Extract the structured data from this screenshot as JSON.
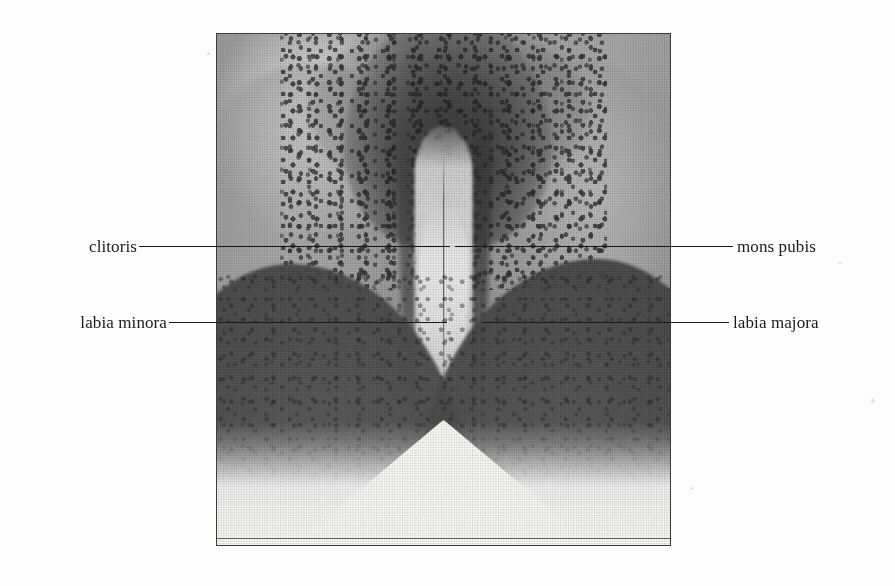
{
  "figure": {
    "background_color": "#fdfdfd",
    "plate": {
      "name": "female-external-genitalia-halftone-plate",
      "border_color": "#3b3b3b",
      "left": 216,
      "top": 33,
      "width": 455,
      "height": 513
    },
    "label_color": "#1b1b1b",
    "leader_color": "#1d1d1d",
    "labels": [
      {
        "id": "clitoris",
        "text": "clitoris",
        "side": "left",
        "text_right_edge": 137,
        "baseline_y": 246,
        "leader_x_start": 139,
        "leader_x_end": 450
      },
      {
        "id": "mons-pubis",
        "text": "mons pubis",
        "side": "right",
        "text_left_edge": 737,
        "baseline_y": 246,
        "leader_x_start": 455,
        "leader_x_end": 733
      },
      {
        "id": "labia-minora",
        "text": "labia minora",
        "side": "left",
        "text_right_edge": 167,
        "baseline_y": 322,
        "leader_x_start": 169,
        "leader_x_end": 447
      },
      {
        "id": "labia-majora",
        "text": "labia majora",
        "side": "right",
        "text_left_edge": 733,
        "baseline_y": 322,
        "leader_x_start": 482,
        "leader_x_end": 729
      }
    ]
  }
}
